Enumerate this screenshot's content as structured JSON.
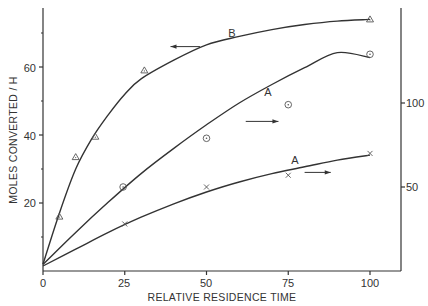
{
  "chart_data": {
    "type": "line",
    "title": "",
    "xlabel": "RELATIVE RESIDENCE TIME",
    "ylabel": "MOLES CONVERTED / H",
    "y2label": "",
    "xlim": [
      0,
      110
    ],
    "ylim": [
      0,
      77
    ],
    "y2lim": [
      0,
      156
    ],
    "x_ticks": [
      0,
      25,
      50,
      75,
      100
    ],
    "y_ticks": [
      20,
      40,
      60
    ],
    "y_minor_ticks": [
      10,
      30,
      50,
      70
    ],
    "y2_ticks": [
      50,
      100
    ],
    "grid": false,
    "legend": null,
    "series": [
      {
        "name": "B",
        "axis": "left",
        "marker": "triangle",
        "points": [
          [
            5,
            16
          ],
          [
            10,
            33.5
          ],
          [
            16,
            39.5
          ],
          [
            31,
            59
          ],
          [
            100,
            74
          ]
        ],
        "curve": [
          [
            0,
            2
          ],
          [
            5,
            17
          ],
          [
            10,
            30
          ],
          [
            15,
            39
          ],
          [
            20,
            46
          ],
          [
            25,
            52
          ],
          [
            30,
            56.5
          ],
          [
            40,
            62
          ],
          [
            50,
            66.5
          ],
          [
            60,
            69
          ],
          [
            70,
            71
          ],
          [
            80,
            72.5
          ],
          [
            90,
            73.5
          ],
          [
            100,
            74
          ]
        ],
        "label": "B",
        "label_pos": [
          58,
          70
        ],
        "arrow": {
          "from": [
            48,
            66
          ],
          "to": [
            39,
            66
          ],
          "direction": "left"
        }
      },
      {
        "name": "A (upper)",
        "axis": "right",
        "marker": "circle-dot",
        "points": [
          [
            24.5,
            50
          ],
          [
            50,
            79
          ],
          [
            75,
            99
          ],
          [
            100,
            129
          ]
        ],
        "curve": [
          [
            0,
            4
          ],
          [
            10,
            23
          ],
          [
            20,
            41
          ],
          [
            30,
            58
          ],
          [
            40,
            73
          ],
          [
            50,
            87
          ],
          [
            60,
            100
          ],
          [
            70,
            111
          ],
          [
            80,
            121
          ],
          [
            90,
            130
          ],
          [
            100,
            127
          ]
        ],
        "label": "A",
        "label_pos": [
          69,
          52
        ],
        "arrow": {
          "from": [
            62,
            44
          ],
          "to": [
            72,
            44
          ],
          "direction": "right"
        }
      },
      {
        "name": "A (lower)",
        "axis": "right",
        "marker": "cross",
        "points": [
          [
            25,
            28
          ],
          [
            50,
            50
          ],
          [
            75,
            57
          ],
          [
            100,
            70
          ]
        ],
        "curve": [
          [
            0,
            3
          ],
          [
            10,
            13
          ],
          [
            20,
            23
          ],
          [
            30,
            32
          ],
          [
            40,
            40
          ],
          [
            50,
            47
          ],
          [
            60,
            53
          ],
          [
            70,
            58
          ],
          [
            80,
            62
          ],
          [
            90,
            66
          ],
          [
            100,
            69
          ]
        ],
        "label": "A",
        "label_pos": [
          77,
          32
        ],
        "arrow": {
          "from": [
            80,
            29
          ],
          "to": [
            88,
            29
          ],
          "direction": "right"
        }
      }
    ]
  },
  "labels": {
    "xlabel": "RELATIVE RESIDENCE TIME",
    "ylabel": "MOLES CONVERTED / H",
    "x_zero": "0",
    "x_25": "25",
    "x_50": "50",
    "x_75": "75",
    "x_100": "100",
    "y_20": "20",
    "y_40": "40",
    "y_60": "60",
    "y2_50": "50",
    "y2_100": "100",
    "curve_b": "B",
    "curve_a_upper": "A",
    "curve_a_lower": "A"
  }
}
